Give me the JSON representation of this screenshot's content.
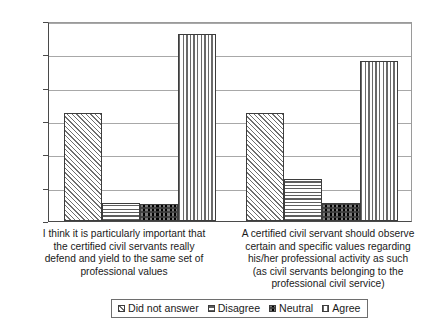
{
  "chart_data": {
    "type": "bar",
    "title": "",
    "xlabel": "",
    "ylabel": "",
    "ylim": [
      0,
      60
    ],
    "y_tick_labels": [
      "0%",
      "10%",
      "20%",
      "30%",
      "40%",
      "50%",
      "60%"
    ],
    "y_tick_values": [
      0,
      10,
      20,
      30,
      40,
      50,
      60
    ],
    "grid": true,
    "legend_position": "bottom",
    "categories": [
      "I think it is particularly important that the certified civil servants really defend and yield to the same set of professional values",
      "A certified civil servant should observe certain and specific values regarding his/her professional activity as such (as civil servants belonging to the professional civil service)"
    ],
    "category_label_lines": [
      [
        "I think it is particularly important that",
        "the certified civil servants really",
        "defend and yield to the same set of",
        "professional values"
      ],
      [
        "A certified civil servant should observe",
        "certain and specific values regarding",
        "his/her professional activity as such",
        "(as civil servants belonging to the",
        "professional civil service)"
      ]
    ],
    "series": [
      {
        "name": "Did not answer",
        "pattern": "diagonal",
        "values": [
          32.5,
          32.5
        ]
      },
      {
        "name": "Disagree",
        "pattern": "horizontal",
        "values": [
          5.5,
          12.5
        ]
      },
      {
        "name": "Neutral",
        "pattern": "checker",
        "values": [
          5.0,
          5.3
        ]
      },
      {
        "name": "Agree",
        "pattern": "vertical",
        "values": [
          56.0,
          48.0
        ]
      }
    ]
  },
  "colors": {
    "axis": "#4a4a4a",
    "gridline": "#a8a8a8",
    "bar_outline": "#3d3d3d",
    "hatch": "#6e6e6e",
    "background": "#ffffff",
    "text": "#1a1a1a"
  }
}
